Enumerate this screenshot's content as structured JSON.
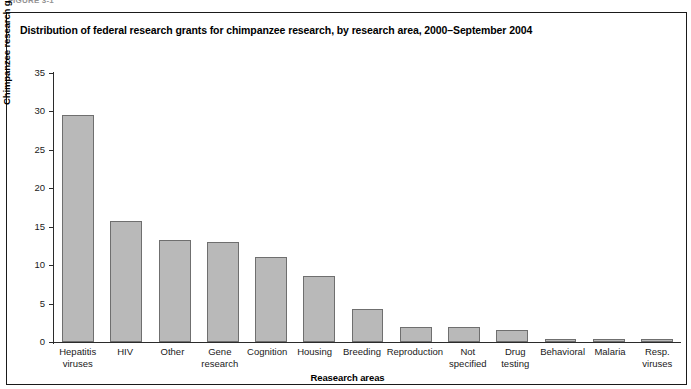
{
  "figure_label": "FIGURE 3-1",
  "panel": {
    "title": "Distribution of federal research grants for chimpanzee research, by research area, 2000–September 2004"
  },
  "colors": {
    "bar_fill": "#b9b9b9",
    "bar_stroke": "#6f6f6f",
    "axis": "#2b2b2b",
    "text": "#1a1a1a",
    "panel_border": "#1a1a1a",
    "background": "#ffffff"
  },
  "chart_data": {
    "type": "bar",
    "title": "Distribution of federal research grants for chimpanzee research, by research area, 2000–September 2004",
    "xlabel": "Reasearch areas",
    "ylabel": "Chimpanzee research grants, by percentage",
    "ylim": [
      0,
      35
    ],
    "yticks": [
      0,
      5,
      10,
      15,
      20,
      25,
      30,
      35
    ],
    "ytick_labels": [
      "0",
      "5",
      "10",
      "15",
      "20",
      "25",
      "30",
      "35"
    ],
    "grid": false,
    "legend": null,
    "categories": [
      "Hepatitis viruses",
      "HIV",
      "Other",
      "Gene research",
      "Cognition",
      "Housing",
      "Breeding",
      "Reproduction",
      "Not specified",
      "Drug testing",
      "Behavioral",
      "Malaria",
      "Resp. viruses"
    ],
    "category_lines": [
      [
        "Hepatitis",
        "viruses"
      ],
      [
        "HIV"
      ],
      [
        "Other"
      ],
      [
        "Gene",
        "research"
      ],
      [
        "Cognition"
      ],
      [
        "Housing"
      ],
      [
        "Breeding"
      ],
      [
        "Reproduction"
      ],
      [
        "Not",
        "specified"
      ],
      [
        "Drug",
        "testing"
      ],
      [
        "Behavioral"
      ],
      [
        "Malaria"
      ],
      [
        "Resp.",
        "viruses"
      ]
    ],
    "values": [
      29.5,
      15.7,
      13.3,
      13.0,
      11.0,
      8.6,
      4.3,
      2.0,
      2.0,
      1.5,
      0.4,
      0.4,
      0.4
    ]
  }
}
